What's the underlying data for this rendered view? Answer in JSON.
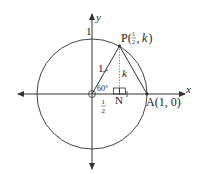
{
  "diagram": {
    "type": "unit-circle",
    "axes": {
      "x_label": "x",
      "y_label": "y"
    },
    "labels": {
      "origin_tick": "1",
      "y_intercept": "1",
      "point_P": "P(",
      "P_frac_num": "1",
      "P_frac_den": "2",
      "P_k": "k",
      "P_close": ")",
      "P_comma": ",",
      "hypotenuse": "1",
      "height": "k",
      "angle": "60°",
      "base_num": "1",
      "base_den": "2",
      "point_N": "N",
      "point_A": "A(1, 0)"
    },
    "geometry": {
      "origin": [
        92,
        94
      ],
      "radius": 55,
      "P": [
        119.5,
        46
      ],
      "N": [
        119.5,
        94
      ],
      "A": [
        147,
        94
      ]
    },
    "colors": {
      "stroke": "#333333",
      "dotted": "#555555"
    }
  }
}
